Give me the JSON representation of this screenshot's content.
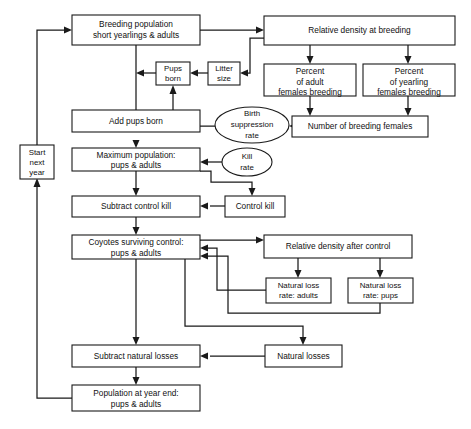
{
  "diagram": {
    "type": "flowchart",
    "background_color": "#ffffff",
    "line_color": "#1a1a1a",
    "nodes": [
      {
        "id": "breeding-population",
        "shape": "rect",
        "lines": [
          "Breeding population",
          "short yearlings & adults"
        ]
      },
      {
        "id": "relative-density-breeding",
        "shape": "rect",
        "lines": [
          "Relative density at breeding"
        ]
      },
      {
        "id": "pups-born",
        "shape": "rect",
        "lines": [
          "Pups",
          "born"
        ]
      },
      {
        "id": "litter-size",
        "shape": "rect",
        "lines": [
          "Litter",
          "size"
        ]
      },
      {
        "id": "percent-adult-females",
        "shape": "rect",
        "lines": [
          "Percent",
          "of adult",
          "females breeding"
        ]
      },
      {
        "id": "percent-yearling-females",
        "shape": "rect",
        "lines": [
          "Percent",
          "of yearling",
          "females breeding"
        ]
      },
      {
        "id": "add-pups-born",
        "shape": "rect",
        "lines": [
          "Add pups born"
        ]
      },
      {
        "id": "birth-suppression-rate",
        "shape": "ellipse",
        "lines": [
          "Birth",
          "suppression",
          "rate"
        ]
      },
      {
        "id": "number-breeding-females",
        "shape": "rect",
        "lines": [
          "Number of breeding females"
        ]
      },
      {
        "id": "maximum-population",
        "shape": "rect",
        "lines": [
          "Maximum population:",
          "pups & adults"
        ]
      },
      {
        "id": "kill-rate",
        "shape": "ellipse",
        "lines": [
          "Kill",
          "rate"
        ]
      },
      {
        "id": "start-next-year",
        "shape": "rect",
        "lines": [
          "Start",
          "next",
          "year"
        ]
      },
      {
        "id": "subtract-control-kill",
        "shape": "rect",
        "lines": [
          "Subtract control kill"
        ]
      },
      {
        "id": "control-kill",
        "shape": "rect",
        "lines": [
          "Control kill"
        ]
      },
      {
        "id": "coyotes-surviving-control",
        "shape": "rect",
        "lines": [
          "Coyotes surviving control:",
          "pups & adults"
        ]
      },
      {
        "id": "relative-density-after-control",
        "shape": "rect",
        "lines": [
          "Relative density after control"
        ]
      },
      {
        "id": "natural-loss-rate-adults",
        "shape": "rect",
        "lines": [
          "Natural loss",
          "rate: adults"
        ]
      },
      {
        "id": "natural-loss-rate-pups",
        "shape": "rect",
        "lines": [
          "Natural loss",
          "rate: pups"
        ]
      },
      {
        "id": "subtract-natural-losses",
        "shape": "rect",
        "lines": [
          "Subtract natural losses"
        ]
      },
      {
        "id": "natural-losses",
        "shape": "rect",
        "lines": [
          "Natural losses"
        ]
      },
      {
        "id": "population-year-end",
        "shape": "rect",
        "lines": [
          "Population at year end:",
          "pups & adults"
        ]
      }
    ]
  }
}
